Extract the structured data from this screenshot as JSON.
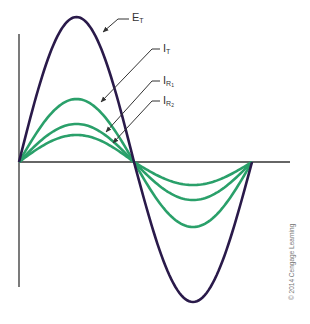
{
  "diagram": {
    "title": "",
    "colors": {
      "voltage": "#2a1a4a",
      "current": "#2aa06a",
      "axis": "#333333",
      "leader": "#333333"
    },
    "axes": {
      "origin": [
        19,
        162
      ],
      "x_end": 290,
      "y_top": 34,
      "y_bottom": 287
    },
    "waves": [
      {
        "id": "E_T",
        "label_main": "E",
        "label_sub": "T",
        "amplitude_up": 145,
        "amplitude_down": 140,
        "color_key": "voltage"
      },
      {
        "id": "I_T",
        "label_main": "I",
        "label_sub": "T",
        "amplitude_up": 63,
        "amplitude_down": 65,
        "color_key": "current"
      },
      {
        "id": "I_R1",
        "label_main": "I",
        "label_sub": "R",
        "label_subsub": "1",
        "amplitude_up": 38,
        "amplitude_down": 38,
        "color_key": "current"
      },
      {
        "id": "I_R2",
        "label_main": "I",
        "label_sub": "R",
        "label_subsub": "2",
        "amplitude_up": 27,
        "amplitude_down": 23,
        "color_key": "current"
      }
    ],
    "period": {
      "start_x": 19,
      "mid_x": 134,
      "end_x": 252
    },
    "labels": {
      "E_T": {
        "main": "E",
        "sub": "T"
      },
      "I_T": {
        "main": "I",
        "sub": "T"
      },
      "I_R1": {
        "main": "I",
        "sub": "R",
        "subsub": "1"
      },
      "I_R2": {
        "main": "I",
        "sub": "R",
        "subsub": "2"
      }
    },
    "credit": "© 2014 Cengage Learning"
  }
}
